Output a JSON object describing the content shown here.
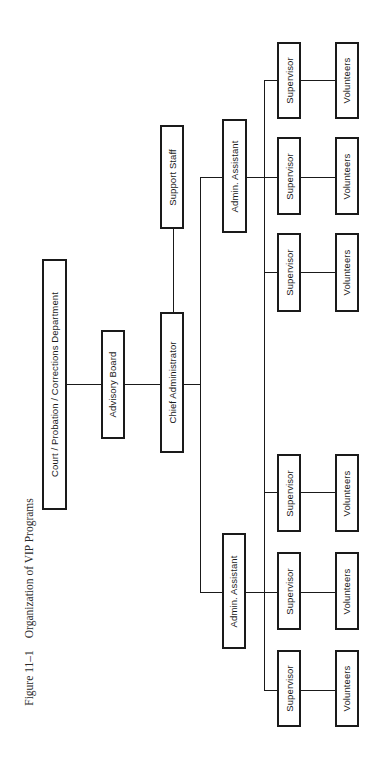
{
  "caption": {
    "figure_number": "Figure 11–1",
    "title": "Organization of VIP Programs"
  },
  "nodes": {
    "court": {
      "label": "Court / Probation / Corrections Department"
    },
    "advisory_board": {
      "label": "Advisory Board"
    },
    "chief_administrator": {
      "label": "Chief Administrator"
    },
    "support_staff": {
      "label": "Support Staff"
    },
    "admin_assistant_1": {
      "label": "Admin. Assistant"
    },
    "admin_assistant_2": {
      "label": "Admin. Assistant"
    },
    "supervisor_1": {
      "label": "Supervisor"
    },
    "supervisor_2": {
      "label": "Supervisor"
    },
    "supervisor_3": {
      "label": "Supervisor"
    },
    "supervisor_4": {
      "label": "Supervisor"
    },
    "supervisor_5": {
      "label": "Supervisor"
    },
    "supervisor_6": {
      "label": "Supervisor"
    },
    "volunteers_1": {
      "label": "Volunteers"
    },
    "volunteers_2": {
      "label": "Volunteers"
    },
    "volunteers_3": {
      "label": "Volunteers"
    },
    "volunteers_4": {
      "label": "Volunteers"
    },
    "volunteers_5": {
      "label": "Volunteers"
    },
    "volunteers_6": {
      "label": "Volunteers"
    }
  },
  "hierarchy": {
    "orientation": "left-to-right (chart rotated 90° counter-clockwise)",
    "edges": [
      [
        "court",
        "advisory_board"
      ],
      [
        "advisory_board",
        "chief_administrator"
      ],
      [
        "chief_administrator",
        "support_staff"
      ],
      [
        "chief_administrator",
        "admin_assistant_1"
      ],
      [
        "chief_administrator",
        "admin_assistant_2"
      ],
      [
        "admin_assistant_1",
        "supervisor_1"
      ],
      [
        "admin_assistant_1",
        "supervisor_2"
      ],
      [
        "admin_assistant_1",
        "supervisor_3"
      ],
      [
        "admin_assistant_2",
        "supervisor_4"
      ],
      [
        "admin_assistant_2",
        "supervisor_5"
      ],
      [
        "admin_assistant_2",
        "supervisor_6"
      ],
      [
        "supervisor_1",
        "volunteers_1"
      ],
      [
        "supervisor_2",
        "volunteers_2"
      ],
      [
        "supervisor_3",
        "volunteers_3"
      ],
      [
        "supervisor_4",
        "volunteers_4"
      ],
      [
        "supervisor_5",
        "volunteers_5"
      ],
      [
        "supervisor_6",
        "volunteers_6"
      ]
    ]
  },
  "colors": {
    "line": "#1a1a1a",
    "background": "#ffffff",
    "caption_text": "#2a2a2a"
  }
}
